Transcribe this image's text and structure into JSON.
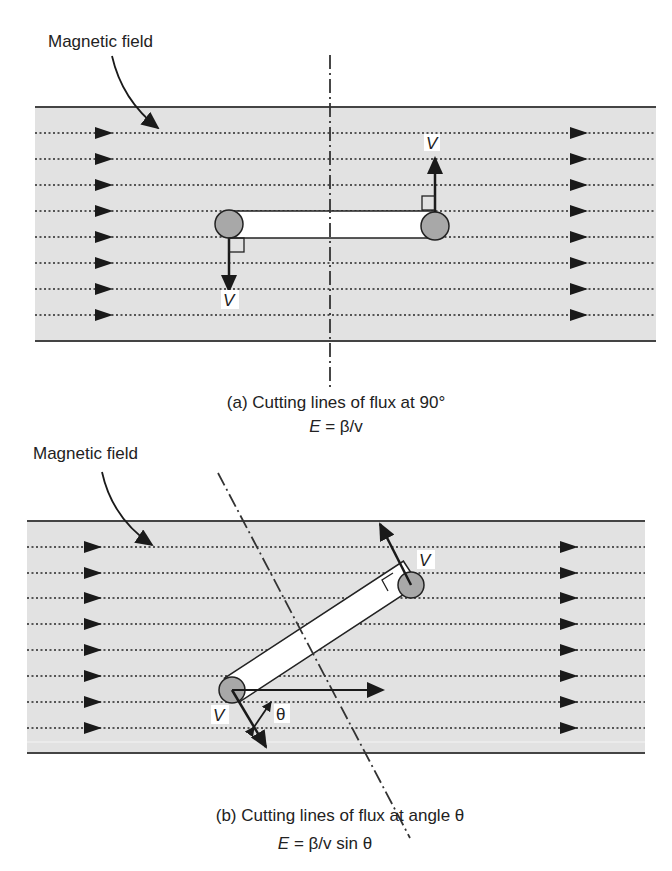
{
  "panel_a": {
    "field_label": "Magnetic field",
    "velocity_label_top": "V",
    "velocity_label_bottom": "V",
    "caption": "(a) Cutting lines of flux at 90°",
    "equation_E": "E",
    "equation_rest": " = β/v"
  },
  "panel_b": {
    "field_label": "Magnetic field",
    "velocity_label_top": "V",
    "velocity_label_bottom": "V",
    "angle_label": "θ",
    "caption": "(b) Cutting lines of flux at angle θ",
    "equation_E": "E",
    "equation_rest": " = β/v sin θ"
  },
  "colors": {
    "field_background": "#e2e2e2",
    "border": "#444444",
    "conductor_fill": "#ffffff",
    "end_circle": "#a8a8a8",
    "ink": "#1a1a1a"
  }
}
